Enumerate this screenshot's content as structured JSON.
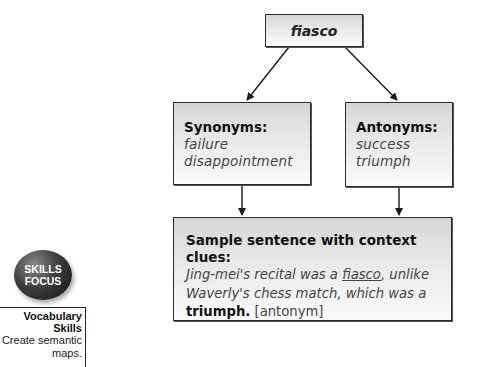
{
  "diagram": {
    "root": {
      "word": "fiasco"
    },
    "synonyms": {
      "heading": "Synonyms:",
      "items": [
        "failure",
        "disappointment"
      ]
    },
    "antonyms": {
      "heading": "Antonyms:",
      "items": [
        "success",
        "triumph"
      ]
    },
    "sample": {
      "heading": "Sample sentence with context clues:",
      "parts": {
        "p1": "Jing-mei's recital was a ",
        "p2": "fiasco",
        "p3": ", ",
        "p4": "unlike",
        "p5": "Waverly's chess match, ",
        "p6": "which",
        "p7": " was a",
        "p8": "triumph.",
        "p9": " [antonym]"
      }
    }
  },
  "sidebar": {
    "badge": {
      "line1": "SKILLS",
      "line2": "FOCUS"
    },
    "skill_box": {
      "title_line1": "Vocabulary",
      "title_line2": "Skills",
      "desc_line1": "Create semantic",
      "desc_line2": "maps."
    }
  },
  "colors": {
    "border": "#2a2a2a",
    "box_top": "#d6d6d6",
    "box_bottom": "#fbfbfb",
    "badge": "#3e3e3e"
  }
}
